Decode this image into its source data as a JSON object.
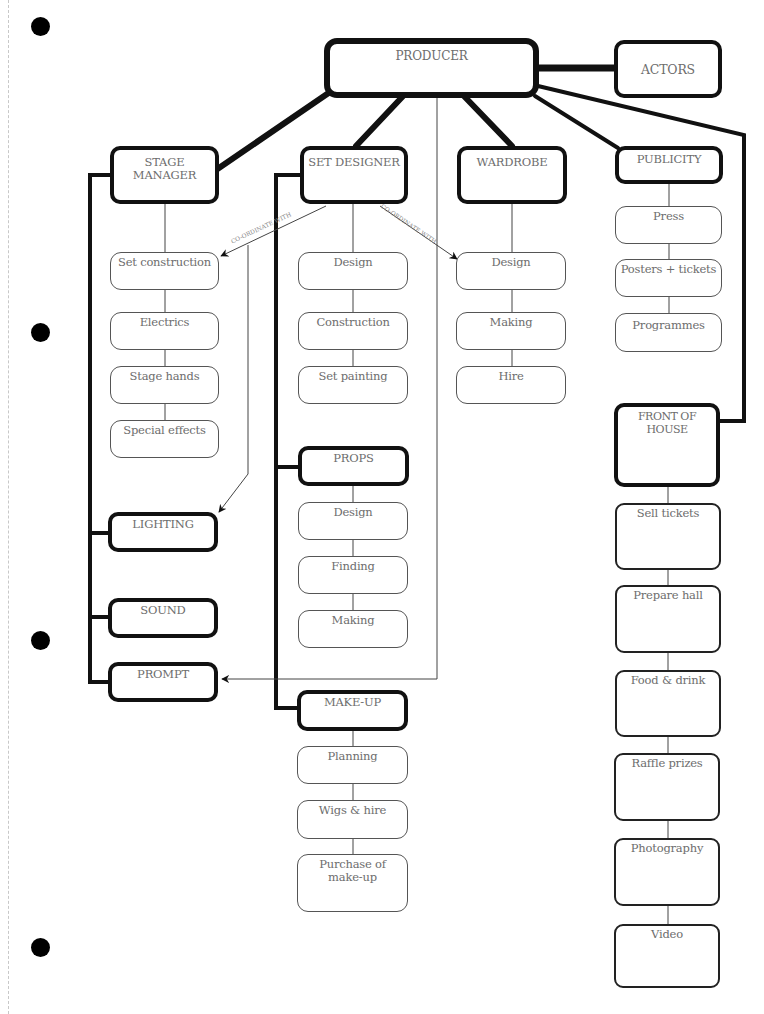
{
  "diagram": {
    "type": "organisational chart",
    "root": "PRODUCER",
    "nodes": {
      "producer": "PRODUCER",
      "actors": "ACTORS",
      "stage_manager": "STAGE MANAGER",
      "set_designer": "SET DESIGNER",
      "wardrobe": "WARDROBE",
      "publicity": "PUBLICITY",
      "front_of_house": "FRONT OF HOUSE",
      "lighting": "LIGHTING",
      "sound": "SOUND",
      "prompt": "PROMPT",
      "props": "PROPS",
      "make_up": "MAKE-UP"
    },
    "stage_manager_tasks": [
      "Set construction",
      "Electrics",
      "Stage hands",
      "Special effects"
    ],
    "set_designer_tasks": [
      "Design",
      "Construction",
      "Set painting"
    ],
    "wardrobe_tasks": [
      "Design",
      "Making",
      "Hire"
    ],
    "publicity_tasks": [
      "Press",
      "Posters + tickets",
      "Programmes"
    ],
    "props_tasks": [
      "Design",
      "Finding",
      "Making"
    ],
    "make_up_tasks": [
      "Planning",
      "Wigs & hire",
      "Purchase of make-up"
    ],
    "front_of_house_tasks": [
      "Sell tickets",
      "Prepare hall",
      "Food & drink",
      "Raffle prizes",
      "Photography",
      "Video"
    ],
    "connector_labels": {
      "set_designer_to_set_construction": "CO-ORDINATE  WITH",
      "set_designer_to_wardrobe_design": "CO-ORDINATE WITH"
    },
    "colors": {
      "line": "#111111",
      "text": "#6d6d6d",
      "background": "#ffffff",
      "hole_punch": "#000000"
    }
  }
}
